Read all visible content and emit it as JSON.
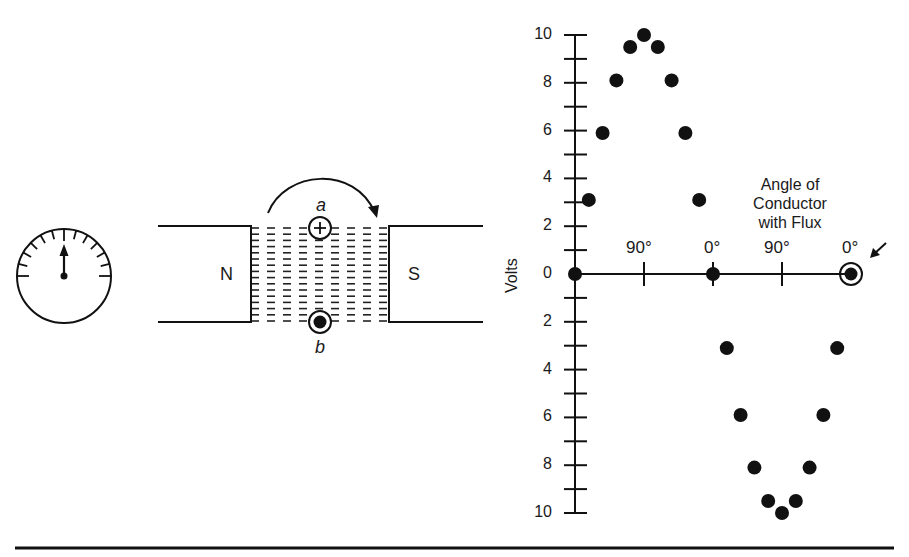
{
  "figure": {
    "meter": {
      "icon": "galvanometer-icon",
      "needle_position": "center"
    },
    "magnet": {
      "north_label": "N",
      "south_label": "S",
      "conductor_a": {
        "label": "a",
        "symbol": "+",
        "meaning": "current into page"
      },
      "conductor_b": {
        "label": "b",
        "symbol": "•",
        "meaning": "current out of page"
      },
      "rotation_arrow": "clockwise-arrow-icon"
    },
    "graph": {
      "ylabel": "Volts",
      "xlabel_line1": "Angle of",
      "xlabel_line2": "Conductor",
      "xlabel_line3": "with Flux",
      "y_tick_labels_upper": [
        "10",
        "8",
        "6",
        "4",
        "2"
      ],
      "y_zero_label": "0",
      "y_tick_labels_lower": [
        "2",
        "4",
        "6",
        "8",
        "10"
      ],
      "x_tick_labels": [
        "90°",
        "0°",
        "90°",
        "0°"
      ],
      "current_position_marker": "arrow-pointer-icon"
    }
  },
  "chart_data": {
    "type": "scatter",
    "title": "",
    "xlabel": "Angle of Conductor with Flux",
    "ylabel": "Volts",
    "x_ticks": [
      {
        "pos": 0,
        "label": ""
      },
      {
        "pos": 90,
        "label": "90°"
      },
      {
        "pos": 180,
        "label": "0°"
      },
      {
        "pos": 270,
        "label": "90°"
      },
      {
        "pos": 360,
        "label": "0°"
      }
    ],
    "ylim": [
      -10,
      10
    ],
    "y_tick_step": 1,
    "y_labeled_ticks": [
      10,
      8,
      6,
      4,
      2,
      0,
      -2,
      -4,
      -6,
      -8,
      -10
    ],
    "y_tick_display_note": "negative half labeled with absolute values 2,4,6,8,10",
    "grid": false,
    "legend": null,
    "series": [
      {
        "name": "Induced voltage",
        "x": [
          0,
          18,
          36,
          54,
          72,
          90,
          108,
          126,
          144,
          162,
          180,
          198,
          216,
          234,
          252,
          270,
          288,
          306,
          324,
          342,
          360
        ],
        "y": [
          0,
          3.1,
          5.9,
          8.1,
          9.5,
          10,
          9.5,
          8.1,
          5.9,
          3.1,
          0,
          -3.1,
          -5.9,
          -8.1,
          -9.5,
          -10,
          -9.5,
          -8.1,
          -5.9,
          -3.1,
          0
        ]
      }
    ],
    "annotations": [
      {
        "x": 360,
        "y": 0,
        "text": "circled point with arrow — current conductor position"
      }
    ]
  }
}
